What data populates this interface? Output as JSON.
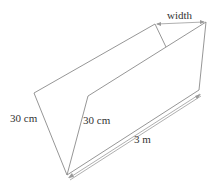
{
  "diagram": {
    "type": "trough / V-shaped open prism",
    "labels": {
      "width": "width",
      "left_side": "30 cm",
      "inner_side": "30 cm",
      "length": "3 m"
    },
    "colors": {
      "edge": "#8a8a8a",
      "text": "#333333",
      "background": "#ffffff"
    }
  }
}
